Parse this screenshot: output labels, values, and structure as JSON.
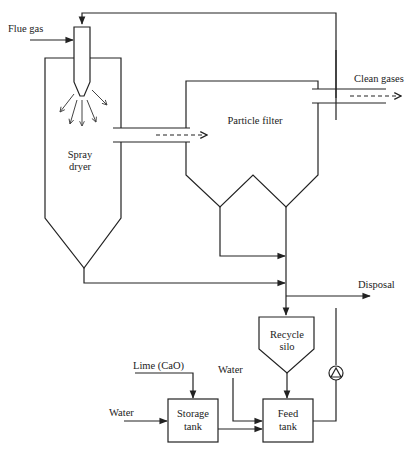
{
  "diagram": {
    "type": "process flow diagram",
    "labels": {
      "flue_gas": "Flue gas",
      "spray_dryer_line1": "Spray",
      "spray_dryer_line2": "dryer",
      "particle_filter": "Particle filter",
      "clean_gases": "Clean gases",
      "disposal": "Disposal",
      "recycle_silo_line1": "Recycle",
      "recycle_silo_line2": "silo",
      "lime": "Lime (CaO)",
      "water_storage": "Water",
      "water_feed": "Water",
      "storage_tank_line1": "Storage",
      "storage_tank_line2": "tank",
      "feed_tank_line1": "Feed",
      "feed_tank_line2": "tank"
    },
    "nodes": [
      {
        "id": "spray-dryer",
        "label": "Spray dryer"
      },
      {
        "id": "particle-filter",
        "label": "Particle filter"
      },
      {
        "id": "recycle-silo",
        "label": "Recycle silo"
      },
      {
        "id": "storage-tank",
        "label": "Storage tank"
      },
      {
        "id": "feed-tank",
        "label": "Feed tank"
      },
      {
        "id": "pump",
        "label": ""
      }
    ],
    "flows": [
      {
        "from": "Flue gas",
        "to": "spray-dryer"
      },
      {
        "from": "spray-dryer",
        "to": "particle-filter",
        "style": "dashed"
      },
      {
        "from": "particle-filter",
        "to": "Clean gases",
        "style": "dashed"
      },
      {
        "from": "particle-filter",
        "to": "recycle-silo"
      },
      {
        "from": "spray-dryer",
        "to": "recycle-silo"
      },
      {
        "from": "collector",
        "to": "Disposal"
      },
      {
        "from": "recycle-silo",
        "to": "feed-tank"
      },
      {
        "from": "Lime (CaO)",
        "to": "storage-tank"
      },
      {
        "from": "Water",
        "to": "storage-tank"
      },
      {
        "from": "Water",
        "to": "feed-tank"
      },
      {
        "from": "storage-tank",
        "to": "feed-tank"
      },
      {
        "from": "feed-tank",
        "to": "pump"
      },
      {
        "from": "pump",
        "to": "spray-dryer"
      }
    ]
  }
}
